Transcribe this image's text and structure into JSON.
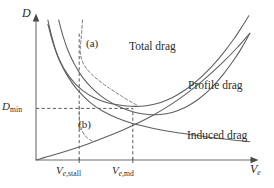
{
  "figure": {
    "kind": "line-plot",
    "background": "#ffffff",
    "ink_color": "#5e5e5e",
    "text_color": "#2b2b2b"
  },
  "axes": {
    "y_label": "D",
    "x_label_base": "V",
    "x_label_sub": "e",
    "y_tick_label_base": "D",
    "y_tick_label_sub": "min",
    "x_tick_labels": [
      {
        "base": "V",
        "sub_italic": "e,",
        "sub_roman": "stall"
      },
      {
        "base": "V",
        "sub_italic": "e,",
        "sub_roman": "md"
      }
    ]
  },
  "curve_labels": {
    "total": "Total drag",
    "profile": "Profile drag",
    "induced": "Induced drag"
  },
  "annotations": {
    "a": "(a)",
    "b": "(b)"
  },
  "chart_data": {
    "type": "line",
    "title": "",
    "xlabel": "Ve",
    "ylabel": "D",
    "grid": false,
    "legend": "inline-curve-labels",
    "xlim": [
      0,
      1
    ],
    "ylim": [
      0,
      1
    ],
    "x_ticks": [
      {
        "label": "Ve,stall",
        "value": 0.2
      },
      {
        "label": "Ve,md",
        "value": 0.46
      }
    ],
    "y_ticks": [
      {
        "label": "Dmin",
        "value": 0.38
      }
    ],
    "series": [
      {
        "name": "Total drag",
        "style": "solid",
        "points": [
          [
            0.055,
            1.0
          ],
          [
            0.07,
            0.9
          ],
          [
            0.09,
            0.79
          ],
          [
            0.115,
            0.695
          ],
          [
            0.145,
            0.615
          ],
          [
            0.18,
            0.548
          ],
          [
            0.22,
            0.492
          ],
          [
            0.265,
            0.448
          ],
          [
            0.315,
            0.416
          ],
          [
            0.37,
            0.396
          ],
          [
            0.42,
            0.386
          ],
          [
            0.46,
            0.383
          ],
          [
            0.51,
            0.388
          ],
          [
            0.57,
            0.408
          ],
          [
            0.63,
            0.445
          ],
          [
            0.69,
            0.5
          ],
          [
            0.75,
            0.572
          ],
          [
            0.81,
            0.662
          ],
          [
            0.865,
            0.76
          ],
          [
            0.915,
            0.862
          ],
          [
            0.955,
            0.955
          ],
          [
            0.985,
            1.03
          ]
        ]
      },
      {
        "name": "Profile drag",
        "style": "solid",
        "points": [
          [
            0.105,
            1.0
          ],
          [
            0.125,
            0.885
          ],
          [
            0.15,
            0.775
          ],
          [
            0.18,
            0.678
          ],
          [
            0.215,
            0.592
          ],
          [
            0.255,
            0.52
          ],
          [
            0.3,
            0.458
          ],
          [
            0.35,
            0.408
          ],
          [
            0.405,
            0.368
          ],
          [
            0.46,
            0.34
          ],
          [
            0.52,
            0.325
          ],
          [
            0.575,
            0.325
          ],
          [
            0.63,
            0.34
          ],
          [
            0.69,
            0.375
          ],
          [
            0.75,
            0.432
          ],
          [
            0.81,
            0.512
          ],
          [
            0.865,
            0.608
          ],
          [
            0.915,
            0.712
          ],
          [
            0.955,
            0.808
          ],
          [
            0.99,
            0.905
          ]
        ]
      },
      {
        "name": "Induced drag",
        "style": "solid",
        "points": [
          [
            0.055,
            0.97
          ],
          [
            0.08,
            0.83
          ],
          [
            0.11,
            0.705
          ],
          [
            0.15,
            0.59
          ],
          [
            0.195,
            0.495
          ],
          [
            0.25,
            0.412
          ],
          [
            0.31,
            0.348
          ],
          [
            0.375,
            0.3
          ],
          [
            0.44,
            0.265
          ],
          [
            0.51,
            0.238
          ],
          [
            0.58,
            0.215
          ],
          [
            0.65,
            0.196
          ],
          [
            0.72,
            0.18
          ],
          [
            0.79,
            0.165
          ],
          [
            0.86,
            0.152
          ],
          [
            0.93,
            0.14
          ],
          [
            0.99,
            0.13
          ]
        ]
      },
      {
        "name": "Parasite rising line",
        "style": "solid",
        "points": [
          [
            0.0,
            0.0
          ],
          [
            0.08,
            0.035
          ],
          [
            0.16,
            0.073
          ],
          [
            0.24,
            0.115
          ],
          [
            0.32,
            0.162
          ],
          [
            0.4,
            0.213
          ],
          [
            0.46,
            0.255
          ],
          [
            0.54,
            0.318
          ],
          [
            0.62,
            0.392
          ],
          [
            0.7,
            0.478
          ],
          [
            0.78,
            0.578
          ],
          [
            0.86,
            0.69
          ],
          [
            0.93,
            0.8
          ],
          [
            0.99,
            0.905
          ]
        ]
      },
      {
        "name": "Stall branch (a)",
        "style": "dashed",
        "points": [
          [
            0.215,
            1.0
          ],
          [
            0.212,
            0.92
          ],
          [
            0.208,
            0.855
          ],
          [
            0.205,
            0.8
          ],
          [
            0.206,
            0.755
          ],
          [
            0.212,
            0.715
          ],
          [
            0.222,
            0.68
          ],
          [
            0.238,
            0.645
          ],
          [
            0.258,
            0.612
          ],
          [
            0.283,
            0.578
          ],
          [
            0.31,
            0.545
          ],
          [
            0.34,
            0.513
          ],
          [
            0.37,
            0.482
          ],
          [
            0.4,
            0.452
          ],
          [
            0.425,
            0.428
          ],
          [
            0.448,
            0.408
          ],
          [
            0.465,
            0.394
          ]
        ]
      },
      {
        "name": "Stall branch (b)",
        "style": "dashed",
        "points": [
          [
            0.2,
            0.385
          ],
          [
            0.2,
            0.33
          ],
          [
            0.202,
            0.285
          ],
          [
            0.206,
            0.245
          ],
          [
            0.213,
            0.212
          ],
          [
            0.222,
            0.185
          ],
          [
            0.234,
            0.162
          ],
          [
            0.248,
            0.146
          ],
          [
            0.262,
            0.136
          ],
          [
            0.275,
            0.132
          ]
        ]
      }
    ]
  }
}
